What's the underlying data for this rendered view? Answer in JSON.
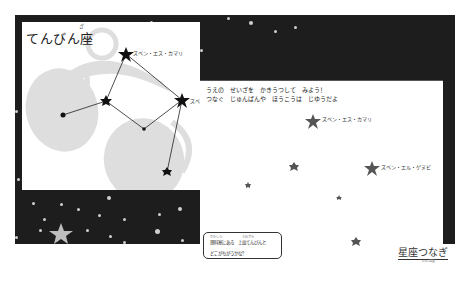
{
  "left_panel": {
    "title": "てんびん座",
    "title_ruby": "ざ",
    "constellation_name": "てんびん座",
    "labels": [
      {
        "text": "ズベン・エス・カマリ"
      },
      {
        "text": "ズベン・エル・ゲヌビ"
      }
    ]
  },
  "right_panel": {
    "instruction_line1": "うえの　せいざを　かきうつして　みよう！",
    "instruction_line2": "つなぐ　じゅんばんや　ほうこうは　じゆうだよ",
    "star_labels": [
      {
        "text": "ズベン・エス・カマリ"
      },
      {
        "text": "ズベン・エル・ゲヌビ"
      }
    ],
    "question": {
      "line1": "理科室にある　上皿てんびんと",
      "line1_ruby_a": "りかしつ",
      "line1_ruby_b": "うわざら",
      "line2": "どこがちがうかな？"
    },
    "logo": "星座つなぎ",
    "logo_sub": "Kids 図鑑"
  },
  "colors": {
    "board_bg": "#1d1d1d",
    "panel_bg": "#ffffff",
    "scale_silhouette": "#dedede",
    "star_dark": "#1a1a1a",
    "star_gray": "#555555",
    "sky_star": "#bdbdbd"
  }
}
